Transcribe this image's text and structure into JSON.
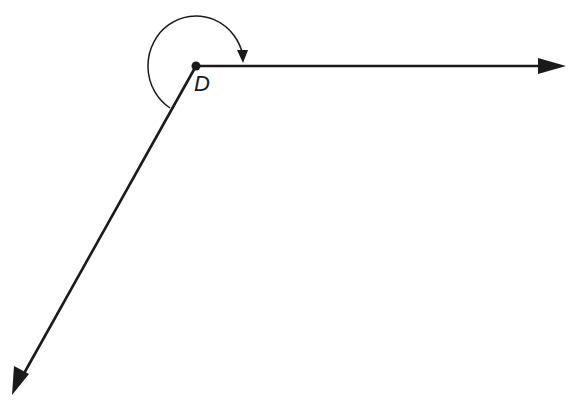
{
  "diagram": {
    "type": "reflex-angle",
    "vertex": {
      "label": "D",
      "x": 196,
      "y": 66
    },
    "rays": [
      {
        "name": "horizontal-ray",
        "x1": 196,
        "y1": 66,
        "x2": 566,
        "y2": 66
      },
      {
        "name": "lower-left-ray",
        "x1": 196,
        "y1": 66,
        "x2": 12,
        "y2": 395
      }
    ],
    "arc": {
      "description": "reflex angle arc with arrow",
      "direction": "clockwise from lower ray over top to horizontal ray"
    },
    "colors": {
      "stroke": "#1a1a1a",
      "background": "#ffffff"
    }
  }
}
